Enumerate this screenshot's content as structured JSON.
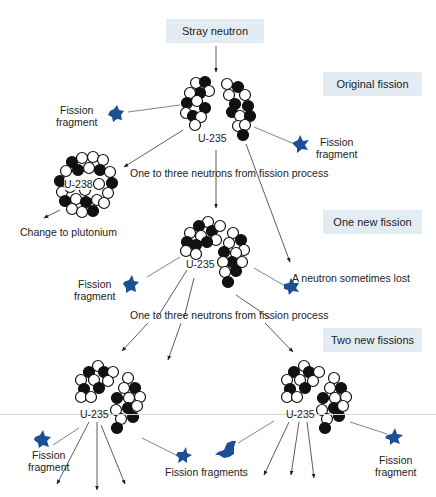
{
  "start_box": {
    "label": "Stray neutron"
  },
  "stages": [
    {
      "label": "Original fission"
    },
    {
      "label": "One new fission"
    },
    {
      "label": "Two new fissions"
    }
  ],
  "nuclei": {
    "u235": "U-235",
    "u238": "U-238"
  },
  "labels": {
    "fission_fragment": "Fission",
    "fission_fragment_line2": "fragment",
    "fission_fragments": "Fission fragments",
    "neutrons_from_process": "One to three neutrons from fission process",
    "change_to_plutonium": "Change to plutonium",
    "neutron_lost": "A neutron sometimes lost"
  },
  "colors": {
    "stage_box_bg": "#e3ecf3",
    "fragment_blue": "#1c4f94",
    "neutron_filled": "#111111",
    "neutron_open": "#ffffff",
    "arrow": "#222222",
    "fragment_line": "#4a6a96"
  }
}
